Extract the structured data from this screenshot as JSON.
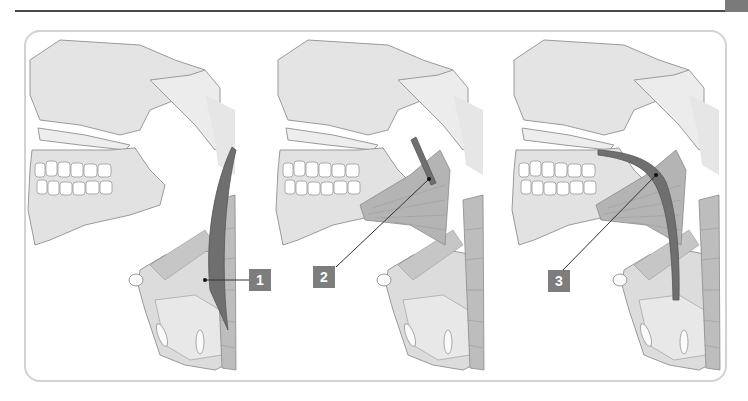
{
  "figure": {
    "panels": [
      {
        "id": "panel-1",
        "label": "1",
        "structure": "posterior pharyngeal muscle (longitudinal band)"
      },
      {
        "id": "panel-2",
        "label": "2",
        "structure": "stylopharyngeus"
      },
      {
        "id": "panel-3",
        "label": "3",
        "structure": "palatopharyngeus"
      }
    ],
    "colors": {
      "bone": "#e4e4e4",
      "bone_outline": "#9a9a9a",
      "muscle_light": "#c8c8c8",
      "muscle_mid": "#a8a8a8",
      "highlight_muscle": "#6f6f6f",
      "badge": "#7d7d7d",
      "frame": "#d2d2d2",
      "rule": "#4a4a4a"
    }
  }
}
